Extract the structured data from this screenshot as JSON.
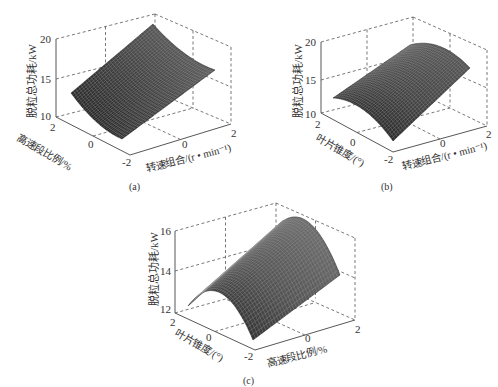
{
  "chart_data": [
    {
      "panel": "a",
      "caption": "(a)",
      "type": "surface3d",
      "zlabel": "脱粒总功耗/kW",
      "xlabel": "转速组合/(r • min⁻¹)",
      "ylabel": "高速段比例/%",
      "x_ticks": [
        "-2",
        "0",
        "2"
      ],
      "y_ticks": [
        "-2",
        "0",
        "2"
      ],
      "z_ticks": [
        "10",
        "15",
        "20"
      ],
      "zlim": [
        10,
        20
      ],
      "surface_corners": {
        "x-2_y2": 12.5,
        "x-2_y-2": 9.5,
        "x2_y2": 21.5,
        "x2_y-2": 16.5
      },
      "shape": "rising with rotational speed combination, slight upward curvature",
      "geom": {
        "zaxis_x": 56,
        "z_top_y": 39,
        "z_mid_y": 79,
        "z_bot_y": 117,
        "back_top": [
          155,
          14
        ],
        "right_top": [
          231,
          47
        ],
        "right_bot": [
          231,
          124
        ],
        "front_bot": [
          130,
          155
        ],
        "front_left": [
          56,
          117
        ],
        "back_bot": [
          155,
          92
        ]
      },
      "surface": {
        "p00": [
          71,
          93
        ],
        "p10": [
          122,
          139
        ],
        "p01": [
          153,
          24
        ],
        "p11": [
          215,
          70
        ],
        "bulge": -6
      }
    },
    {
      "panel": "b",
      "caption": "(b)",
      "type": "surface3d",
      "zlabel": "脱粒总功耗/kW",
      "xlabel": "转速组合/(r • min⁻¹)",
      "ylabel": "叶片锥度/(°)",
      "x_ticks": [
        "-2",
        "0",
        "2"
      ],
      "y_ticks": [
        "-2",
        "0",
        "2"
      ],
      "z_ticks": [
        "10",
        "15",
        "20"
      ],
      "zlim": [
        10,
        20
      ],
      "surface_corners": {
        "x-2_y2": 11,
        "x-2_y-2": 10,
        "x2_y2": 18.5,
        "x2_y-2": 17
      },
      "shape": "rising with rotational speed combination, concave-down across blade taper",
      "geom": {
        "zaxis_x": 321,
        "z_top_y": 42,
        "z_mid_y": 80,
        "z_bot_y": 115,
        "back_top": [
          413,
          17
        ],
        "right_top": [
          487,
          50
        ],
        "right_bot": [
          487,
          126
        ],
        "front_bot": [
          393,
          152
        ],
        "front_left": [
          321,
          113
        ],
        "back_bot": [
          413,
          90
        ]
      },
      "surface": {
        "p00": [
          333,
          98
        ],
        "p10": [
          393,
          141
        ],
        "p01": [
          410,
          45
        ],
        "p11": [
          470,
          68
        ],
        "bulge": 10
      }
    },
    {
      "panel": "c",
      "caption": "(c)",
      "type": "surface3d",
      "zlabel": "脱粒总功耗/kW",
      "xlabel": "高速段比例/%",
      "ylabel": "叶片锥度/(°)",
      "x_ticks": [
        "-2",
        "0",
        "2"
      ],
      "y_ticks": [
        "-2",
        "0",
        "2"
      ],
      "z_ticks": [
        "12",
        "14",
        "16"
      ],
      "zlim": [
        12,
        16
      ],
      "surface_corners": {
        "x-2_y2": 12,
        "x-2_y-2": 11.5,
        "x2_y2": 15.5,
        "x2_y-2": 14.5
      },
      "shape": "rising with high-speed section ratio, strongly concave-down across blade taper (ridge near 0)",
      "geom": {
        "zaxis_x": 175,
        "z_top_y": 231,
        "z_mid_y": 271,
        "z_bot_y": 309,
        "back_top": [
          276,
          203
        ],
        "right_top": [
          355,
          238
        ],
        "right_bot": [
          355,
          320
        ],
        "front_bot": [
          255,
          350
        ],
        "front_left": [
          175,
          313
        ],
        "back_bot": [
          276,
          285
        ]
      },
      "surface": {
        "p00": [
          188,
          306
        ],
        "p10": [
          253,
          340
        ],
        "p01": [
          275,
          228
        ],
        "p11": [
          340,
          275
        ],
        "bulge": 30
      }
    }
  ]
}
